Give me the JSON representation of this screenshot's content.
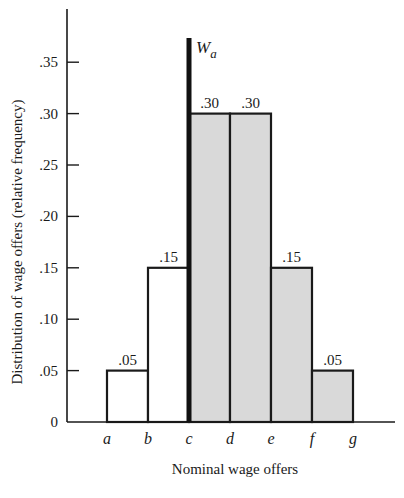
{
  "chart_data": {
    "type": "bar",
    "title": "",
    "xlabel": "Nominal wage offers",
    "ylabel": "Distribution of wage offers (relative frequency)",
    "categories": [
      "a-b",
      "b-c",
      "c-d",
      "d-e",
      "e-f",
      "f-g"
    ],
    "bin_edges": [
      "a",
      "b",
      "c",
      "d",
      "e",
      "f",
      "g"
    ],
    "values": [
      0.05,
      0.15,
      0.3,
      0.3,
      0.15,
      0.05
    ],
    "value_labels": [
      ".05",
      ".15",
      ".30",
      ".30",
      ".15",
      ".05"
    ],
    "shaded": [
      false,
      false,
      true,
      true,
      true,
      true
    ],
    "ylim": [
      0,
      0.37
    ],
    "yticks": [
      0,
      0.05,
      0.1,
      0.15,
      0.2,
      0.25,
      0.3,
      0.35
    ],
    "ytick_labels": [
      "0",
      ".05",
      ".10",
      ".15",
      ".20",
      ".25",
      ".30",
      ".35"
    ],
    "annotations": [
      {
        "type": "vertical-line",
        "x": "c",
        "label": "W_a",
        "label_main": "W",
        "label_sub": "a"
      }
    ],
    "grid": false,
    "legend": null,
    "colors": {
      "shaded_fill": "#d9d9d9",
      "unshaded_fill": "#ffffff",
      "stroke": "#1a1a1a"
    }
  }
}
